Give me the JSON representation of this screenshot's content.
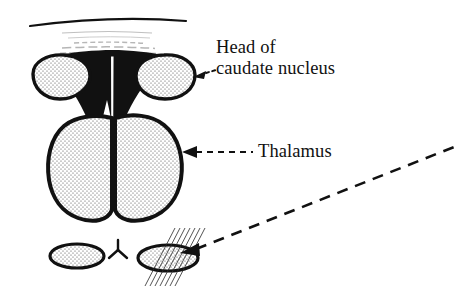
{
  "figure": {
    "kind": "anatomical-line-drawing",
    "background_color": "#ffffff",
    "ink_color": "#111111",
    "width": 454,
    "height": 286
  },
  "labels": {
    "caudate": {
      "line1": "Head of",
      "line2": "caudate nucleus"
    },
    "thalamus": {
      "line1": "Thalamus"
    }
  },
  "structures": [
    {
      "name": "caudate-head-left",
      "fill": "stipple",
      "outline_color": "#111111"
    },
    {
      "name": "caudate-head-right",
      "fill": "stipple",
      "outline_color": "#111111"
    },
    {
      "name": "lateral-ventricle",
      "fill": "solid-black",
      "outline_color": "#111111"
    },
    {
      "name": "midline-slit",
      "fill": "white",
      "outline_color": "#ffffff"
    },
    {
      "name": "thalamus-left",
      "fill": "stipple",
      "outline_color": "#111111"
    },
    {
      "name": "thalamus-right",
      "fill": "stipple",
      "outline_color": "#111111"
    },
    {
      "name": "inferior-oval-left",
      "fill": "stipple",
      "outline_color": "#111111"
    },
    {
      "name": "inferior-oval-right-hatched",
      "fill": "stipple-with-hatching",
      "outline_color": "#111111"
    },
    {
      "name": "midline-y-mark",
      "fill": "none",
      "outline_color": "#111111"
    },
    {
      "name": "superior-arc",
      "fill": "none",
      "outline_color": "#111111"
    },
    {
      "name": "scan-smudge-lines",
      "fill": "none",
      "outline_color": "#888888"
    }
  ],
  "leaders": [
    {
      "name": "caudate-leader",
      "style": "short-dashed",
      "arrowhead": "left"
    },
    {
      "name": "thalamus-leader",
      "style": "dashed",
      "arrowhead": "left"
    },
    {
      "name": "inset-leader",
      "style": "long-dashed",
      "arrowhead": "left"
    }
  ]
}
